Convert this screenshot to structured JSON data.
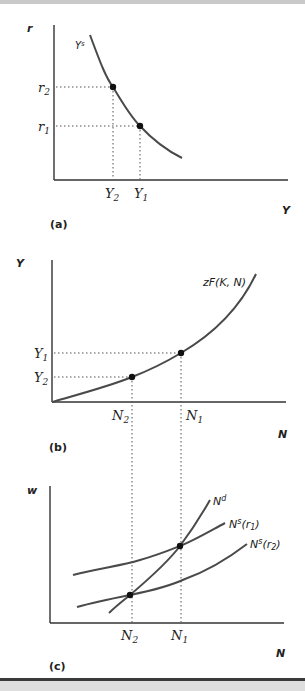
{
  "figure": {
    "colors": {
      "curve": "#4a4a4a",
      "axis": "#333333",
      "dot": "#111111",
      "dotted": "#555555",
      "text": "#222222"
    },
    "panels": [
      {
        "id": "a",
        "panel_label": "(a)",
        "y_axis_label": "r",
        "x_axis_label": "Y",
        "curve_label": "Ys",
        "curve_label_base": "Y",
        "curve_label_sup": "s",
        "y_ticks": [
          {
            "base": "r",
            "sub": "2"
          },
          {
            "base": "r",
            "sub": "1"
          }
        ],
        "x_ticks": [
          {
            "base": "Y",
            "sub": "2"
          },
          {
            "base": "Y",
            "sub": "1"
          }
        ]
      },
      {
        "id": "b",
        "panel_label": "(b)",
        "y_axis_label": "Y",
        "x_axis_label": "N",
        "curve_label": "zF(K, N)",
        "y_ticks": [
          {
            "base": "Y",
            "sub": "1"
          },
          {
            "base": "Y",
            "sub": "2"
          }
        ],
        "x_ticks": [
          {
            "base": "N",
            "sub": "2"
          },
          {
            "base": "N",
            "sub": "1"
          }
        ]
      },
      {
        "id": "c",
        "panel_label": "(c)",
        "y_axis_label": "w",
        "x_axis_label": "N",
        "curves": [
          {
            "label_base": "N",
            "label_sup": "d",
            "label_rest": ""
          },
          {
            "label_base": "N",
            "label_sup": "s",
            "label_rest": "(r",
            "label_sub": "1",
            "label_end": ")"
          },
          {
            "label_base": "N",
            "label_sup": "s",
            "label_rest": "(r",
            "label_sub": "2",
            "label_end": ")"
          }
        ],
        "x_ticks": [
          {
            "base": "N",
            "sub": "2"
          },
          {
            "base": "N",
            "sub": "1"
          }
        ]
      }
    ]
  }
}
